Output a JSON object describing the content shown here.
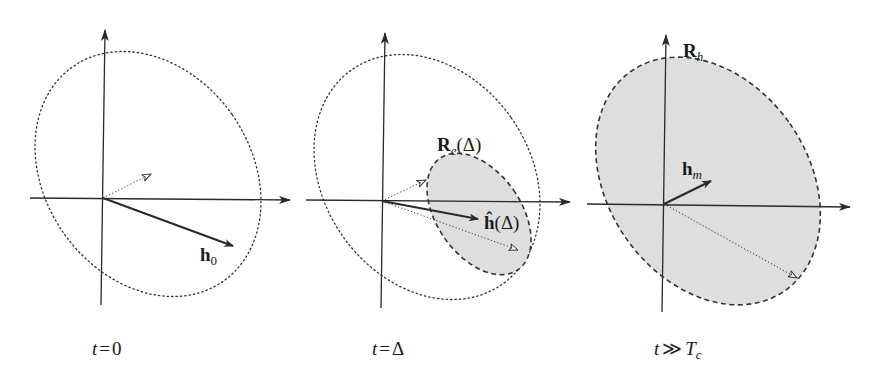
{
  "figure": {
    "panels": [
      {
        "id": "t0",
        "caption": {
          "var": "t",
          "rel": "=",
          "value": "0"
        },
        "vector_label": {
          "base": "h",
          "sub": "0"
        },
        "ellipse_style": "dotted",
        "shaded_region": null
      },
      {
        "id": "tDelta",
        "caption": {
          "var": "t",
          "rel": "=",
          "value": "Δ"
        },
        "vector_label": {
          "base": "ĥ",
          "arg": "(Δ)"
        },
        "region_label": {
          "base": "R",
          "sub": "e",
          "arg": "(Δ)"
        },
        "ellipse_style": "dotted",
        "shaded_region": "dashed"
      },
      {
        "id": "tLarge",
        "caption": {
          "var": "t",
          "rel": "≫",
          "value": "T",
          "sub": "c"
        },
        "vector_label": {
          "base": "h",
          "sub": "m"
        },
        "region_label": {
          "base": "R",
          "sub": "h"
        },
        "ellipse_style": null,
        "shaded_region": "dashed"
      }
    ],
    "colors": {
      "ink": "#2a2a2a",
      "shade": "#dedede",
      "background": "#ffffff"
    }
  }
}
